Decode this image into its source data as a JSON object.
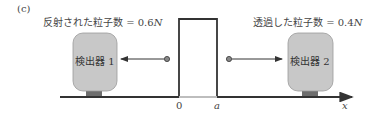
{
  "figure": {
    "panel_label": "(c)",
    "reflected_label": "反射された粒子数 = 0.6",
    "reflected_symbol": "N",
    "transmitted_label": "透過した粒子数 = 0.4",
    "transmitted_symbol": "N",
    "detector_left": "検出器 1",
    "detector_right": "検出器 2",
    "axis_origin": "0",
    "axis_a": "a",
    "axis_x": "x"
  },
  "colors": {
    "detector_fill": "#c8c8c8",
    "detector_stand": "#6e6e6e",
    "line": "#333333"
  }
}
